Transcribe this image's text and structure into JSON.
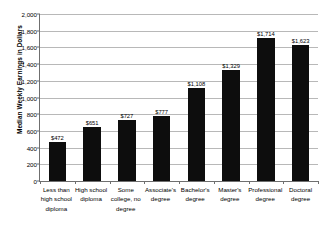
{
  "chart_data": {
    "type": "bar",
    "title": "",
    "xlabel": "",
    "ylabel": "Median Weekly Earnings in Dollars",
    "ylim": [
      0,
      2000
    ],
    "ytick_step": 200,
    "grid": true,
    "legend": "none",
    "bar_color": "#0d0d0d",
    "gridline_color": "#b8b8b8",
    "axis_color": "#6f6f6f",
    "categories": [
      "Less than high school diploma",
      "High school diploma",
      "Some college, no degree",
      "Associate's degree",
      "Bachelor's degree",
      "Master's degree",
      "Professional degree",
      "Doctoral degree"
    ],
    "values": [
      472,
      651,
      727,
      777,
      1108,
      1329,
      1714,
      1623
    ],
    "value_labels": [
      "$472",
      "$651",
      "$727",
      "$777",
      "$1,108",
      "$1,329",
      "$1,714",
      "$1,623"
    ],
    "ytick_labels": [
      "2,000",
      "1,800",
      "1,600",
      "1,400",
      "1,200",
      "1,000",
      "800",
      "600",
      "400",
      "200",
      "0"
    ],
    "ytick_values": [
      2000,
      1800,
      1600,
      1400,
      1200,
      1000,
      800,
      600,
      400,
      200,
      0
    ]
  }
}
